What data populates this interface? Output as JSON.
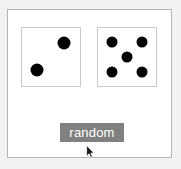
{
  "app": {
    "background_color": "#f2f2f2",
    "canvas_color": "#ffffff",
    "canvas_border_color": "#b4b4b4"
  },
  "dice": {
    "pip_color": "#000000",
    "face_color": "#ffffff",
    "border_color": "#c8c8c8",
    "items": [
      {
        "name": "die-left",
        "value": 2,
        "pips": [
          {
            "x": 72,
            "y": 25
          },
          {
            "x": 26,
            "y": 73
          }
        ]
      },
      {
        "name": "die-right",
        "value": 5,
        "pips": [
          {
            "x": 24,
            "y": 24
          },
          {
            "x": 76,
            "y": 24
          },
          {
            "x": 50,
            "y": 50
          },
          {
            "x": 24,
            "y": 76
          },
          {
            "x": 76,
            "y": 76
          }
        ]
      }
    ]
  },
  "button": {
    "label": "random",
    "background_color": "#808080",
    "text_color": "#ffffff"
  },
  "cursor": {
    "icon": "arrow-pointer-icon",
    "x": 85,
    "y": 144
  }
}
